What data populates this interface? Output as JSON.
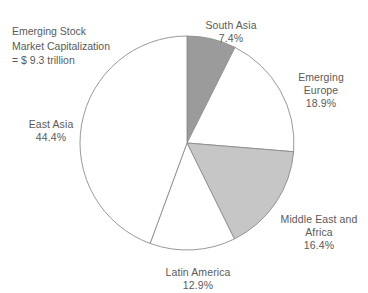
{
  "chart_data": {
    "type": "pie",
    "title": "",
    "caption": "Emerging Stock\nMarket Capitalization\n= $ 9.3 trillion",
    "categories": [
      "South Asia",
      "Emerging Europe",
      "Middle East and Africa",
      "Latin America",
      "East Asia"
    ],
    "values": [
      7.4,
      18.9,
      16.4,
      12.9,
      44.4
    ],
    "value_labels": [
      "7.4%",
      "18.9%",
      "16.4%",
      "12.9%",
      "44.4%"
    ],
    "unit": "percent",
    "total_label": "= $ 9.3 trillion",
    "total_value": 9.3,
    "total_unit": "trillion USD",
    "start_angle_deg": 0,
    "direction": "clockwise",
    "legend": "none",
    "labels_position": "outside",
    "slice_colors": [
      "#9b9b9b",
      "#ffffff",
      "#c6c6c6",
      "#ffffff",
      "#ffffff"
    ],
    "outline_color": "#8c8c8c",
    "slices": [
      {
        "name": "South Asia",
        "value": 7.4,
        "label": "South Asia",
        "pct_label": "7.4%",
        "color": "#9b9b9b"
      },
      {
        "name": "Emerging Europe",
        "value": 18.9,
        "label": "Emerging\nEurope",
        "pct_label": "18.9%",
        "color": "#ffffff"
      },
      {
        "name": "Middle East and Africa",
        "value": 16.4,
        "label": "Middle East and\nAfrica",
        "pct_label": "16.4%",
        "color": "#c6c6c6"
      },
      {
        "name": "Latin America",
        "value": 12.9,
        "label": "Latin America",
        "pct_label": "12.9%",
        "color": "#ffffff"
      },
      {
        "name": "East Asia",
        "value": 44.4,
        "label": "East Asia",
        "pct_label": "44.4%",
        "color": "#ffffff"
      }
    ]
  },
  "labels": {
    "caption": "Emerging Stock\nMarket Capitalization\n= $ 9.3 trillion",
    "south_asia": "South Asia",
    "south_asia_pct": "7.4%",
    "emerging_europe": "Emerging\nEurope",
    "emerging_europe_pct": "18.9%",
    "middle_east": "Middle East and\nAfrica",
    "middle_east_pct": "16.4%",
    "latin_america": "Latin America",
    "latin_america_pct": "12.9%",
    "east_asia": "East Asia",
    "east_asia_pct": "44.4%"
  },
  "geometry": {
    "center_x": 187,
    "center_y": 143,
    "radius": 107
  }
}
